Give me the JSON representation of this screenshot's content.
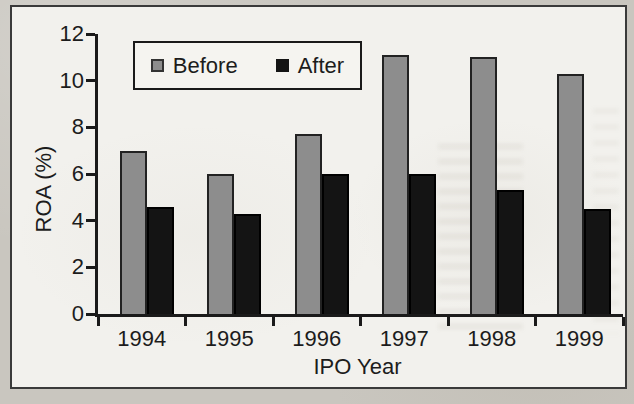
{
  "chart_data": {
    "type": "bar",
    "title": "",
    "categories": [
      "1994",
      "1995",
      "1996",
      "1997",
      "1998",
      "1999"
    ],
    "series": [
      {
        "name": "Before",
        "color": "#8d8d8d",
        "values": [
          7.0,
          6.0,
          7.7,
          11.1,
          11.0,
          10.3
        ]
      },
      {
        "name": "After",
        "color": "#141414",
        "values": [
          4.6,
          4.3,
          6.0,
          6.0,
          5.3,
          4.5
        ]
      }
    ],
    "xlabel": "IPO Year",
    "ylabel": "ROA (%)",
    "ylim": [
      0,
      12
    ],
    "yticks": [
      0,
      2,
      4,
      6,
      8,
      10,
      12
    ],
    "grid": false,
    "legend_position": "top-center-inside",
    "colors": {
      "before_bar": "#8d8d8d",
      "after_bar": "#141414",
      "axis": "#1a1a1a",
      "paper": "#c9c6bf",
      "figure_bg": "#f2f1ed"
    }
  }
}
